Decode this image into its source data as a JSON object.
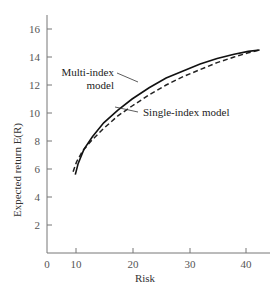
{
  "chart_data": {
    "type": "line",
    "title": "",
    "xlabel": "Risk",
    "ylabel": "Expected return E(R)",
    "xlim": [
      0,
      44
    ],
    "ylim": [
      0,
      17
    ],
    "grid": false,
    "legend": "none (inline annotations)",
    "x_ticks": [
      0,
      10,
      20,
      30,
      40
    ],
    "y_ticks": [
      2,
      4,
      6,
      8,
      10,
      12,
      14,
      16
    ],
    "series": [
      {
        "name": "Multi-index model",
        "style": "solid",
        "x": [
          5.0,
          5.5,
          6.5,
          8,
          10,
          12.5,
          15,
          18,
          21,
          24,
          27,
          30,
          33,
          35.5,
          37.5
        ],
        "y": [
          5.6,
          6.4,
          7.4,
          8.3,
          9.3,
          10.2,
          11.0,
          11.8,
          12.5,
          13.0,
          13.5,
          13.9,
          14.2,
          14.4,
          14.5
        ]
      },
      {
        "name": "Single-index model",
        "style": "dashed",
        "x": [
          4.6,
          5.2,
          6.3,
          8,
          10,
          12.5,
          15,
          18,
          21,
          24,
          27,
          30,
          33,
          35.5,
          37.5
        ],
        "y": [
          5.8,
          6.5,
          7.3,
          8.1,
          8.9,
          9.8,
          10.5,
          11.3,
          12.0,
          12.6,
          13.1,
          13.6,
          14.0,
          14.3,
          14.5
        ]
      }
    ],
    "annotations": [
      {
        "text_line1": "Multi-index",
        "text_line2": "model",
        "points_to": "Multi-index model"
      },
      {
        "text": "Single-index model",
        "points_to": "Single-index model"
      }
    ]
  },
  "axis": {
    "x_title": "Risk",
    "y_title": "Expected return E(R)",
    "x_tick_labels": [
      "0",
      "10",
      "20",
      "30",
      "40"
    ],
    "y_tick_labels": [
      "2",
      "4",
      "6",
      "8",
      "10",
      "12",
      "14",
      "16"
    ]
  },
  "labels": {
    "multi_line1": "Multi-index",
    "multi_line2": "model",
    "single": "Single-index model"
  }
}
